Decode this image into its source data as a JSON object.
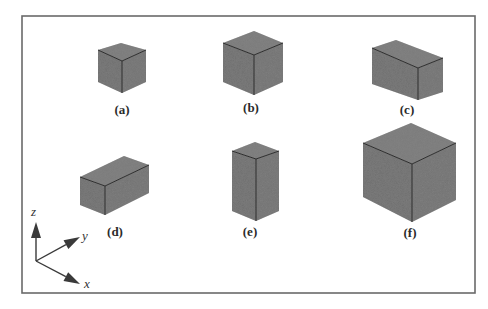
{
  "figure": {
    "frame": {
      "x": 22,
      "y": 16,
      "width": 453,
      "height": 277,
      "stroke": "#6a6a6a"
    },
    "colors": {
      "box_top": "#7a7a7a",
      "box_left": "#6e6e6e",
      "box_right": "#727272",
      "edge": "#2e2e2e",
      "axis": "#3a3a3a"
    },
    "boxes": [
      {
        "id": "a",
        "label": "(a)",
        "label_x": 122,
        "label_y": 114,
        "top": "98,50 121,43 146,50 122,61",
        "left": "98,50 122,61 122,93 98,82",
        "right": "122,61 146,50 146,82 122,93",
        "edge_v": "122,61 122,93",
        "edge_l": "98,50 122,61",
        "edge_r": "122,61 146,50"
      },
      {
        "id": "b",
        "label": "(b)",
        "label_x": 251,
        "label_y": 112,
        "top": "223,43 254,31 283,43 254,55",
        "left": "223,43 254,55 254,95 223,82",
        "right": "254,55 283,43 283,82 254,95",
        "edge_v": "254,55 254,95",
        "edge_l": "223,43 254,55",
        "edge_r": "254,55 283,43"
      },
      {
        "id": "c",
        "label": "(c)",
        "label_x": 407,
        "label_y": 114,
        "top": "372,48 396,40 443,58 418,68",
        "left": "372,48 418,68 418,100 372,84",
        "right": "418,68 443,58 443,92 418,100",
        "edge_v": "418,68 418,100",
        "edge_l": "372,48 418,68",
        "edge_r": "418,68 443,58"
      },
      {
        "id": "d",
        "label": "(d)",
        "label_x": 115,
        "label_y": 236,
        "top": "80,177 124,156 149,165 105,186",
        "left": "80,177 105,186 105,215 80,205",
        "right": "105,186 149,165 149,193 105,215",
        "edge_v": "105,186 105,215",
        "edge_l": "80,177 105,186",
        "edge_r": "105,186 149,165"
      },
      {
        "id": "e",
        "label": "(e)",
        "label_x": 250,
        "label_y": 236,
        "top": "232,151 255,142 279,151 256,159",
        "left": "232,151 256,159 256,221 232,211",
        "right": "256,159 279,151 279,211 256,221",
        "edge_v": "256,159 256,221",
        "edge_l": "232,151 256,159",
        "edge_r": "256,159 279,151"
      },
      {
        "id": "f",
        "label": "(f)",
        "label_x": 410,
        "label_y": 237,
        "top": "363,143 411,123 456,143 412,164",
        "left": "363,143 412,164 412,222 363,197",
        "right": "412,164 456,143 456,200 412,222",
        "edge_v": "412,164 412,222",
        "edge_l": "363,143 412,164",
        "edge_r": "412,164 456,143"
      }
    ],
    "axes": {
      "origin": [
        36,
        261
      ],
      "z": {
        "label": "z",
        "tip": [
          36,
          222
        ],
        "label_x": 31,
        "label_y": 216
      },
      "y": {
        "label": "y",
        "tip": [
          80,
          237
        ],
        "label_x": 82,
        "label_y": 240
      },
      "x": {
        "label": "x",
        "tip": [
          80,
          284
        ],
        "label_x": 84,
        "label_y": 288
      }
    }
  }
}
